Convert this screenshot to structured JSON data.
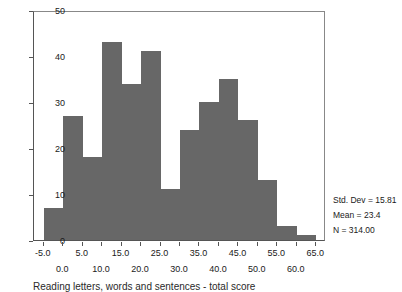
{
  "chart_data": {
    "type": "bar",
    "title": "",
    "subtitle": "",
    "xlabel": "Reading letters, words and sentences - total score",
    "ylabel": "",
    "xlim": [
      -7.5,
      67.5
    ],
    "ylim": [
      0,
      50
    ],
    "grid": false,
    "legend": null,
    "bin_width": 5,
    "categories": [
      "-5 to 0",
      "0 to 5",
      "5 to 10",
      "10 to 15",
      "15 to 20",
      "20 to 25",
      "25 to 30",
      "30 to 35",
      "35 to 40",
      "40 to 45",
      "45 to 50",
      "50 to 55",
      "55 to 60",
      "60 to 65"
    ],
    "bin_edges": [
      -5,
      0,
      5,
      10,
      15,
      20,
      25,
      30,
      35,
      40,
      45,
      50,
      55,
      60,
      65
    ],
    "values": [
      7,
      27,
      18,
      43,
      34,
      41,
      11,
      24,
      30,
      35,
      26,
      13,
      3,
      1
    ],
    "x_ticks_row1": [
      "-5.0",
      "5.0",
      "15.0",
      "25.0",
      "35.0",
      "45.0",
      "55.0",
      "65.0"
    ],
    "x_ticks_row1_values": [
      -5,
      5,
      15,
      25,
      35,
      45,
      55,
      65
    ],
    "x_ticks_row2": [
      "0.0",
      "10.0",
      "20.0",
      "30.0",
      "40.0",
      "50.0",
      "60.0"
    ],
    "x_ticks_row2_values": [
      0,
      10,
      20,
      30,
      40,
      50,
      60
    ],
    "y_ticks": [
      "0",
      "10",
      "20",
      "30",
      "40",
      "50"
    ],
    "y_tick_values": [
      0,
      10,
      20,
      30,
      40,
      50
    ],
    "bar_color": "#676767",
    "axis_color": "#555555",
    "annotations": {
      "std_dev": "Std. Dev = 15.81",
      "mean": "Mean = 23.4",
      "n": "N = 314.00"
    }
  },
  "caption": "Reading letters, words and sentences - total score"
}
